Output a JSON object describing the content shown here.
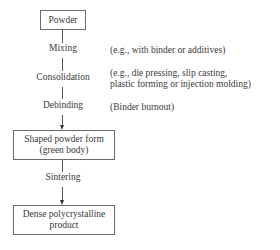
{
  "diagram": {
    "boxes": {
      "powder": "Powder",
      "green_body_line1": "Shaped powder form",
      "green_body_line2": "(green body)",
      "product_line1": "Dense polycrystalline",
      "product_line2": "product"
    },
    "steps": {
      "mixing": "Mixing",
      "consolidation": "Consolidation",
      "debinding": "Debinding",
      "sintering": "Sintering"
    },
    "notes": {
      "mixing": "(e.g., with binder or additives)",
      "consolidation_line1": "(e.g., die pressing, slip casting,",
      "consolidation_line2": "plastic forming or injection molding)",
      "debinding": "(Binder burnout)"
    }
  }
}
